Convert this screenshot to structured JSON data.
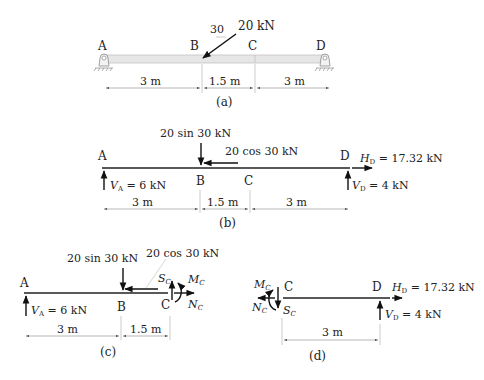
{
  "figure": {
    "part_a": {
      "caption": "(a)",
      "points": {
        "A": "A",
        "B": "B",
        "C": "C",
        "D": "D"
      },
      "load_label": "20 kN",
      "angle_label": "30",
      "dimensions": [
        "3 m",
        "1.5 m",
        "3 m"
      ]
    },
    "part_b": {
      "caption": "(b)",
      "points": {
        "A": "A",
        "B": "B",
        "C": "C",
        "D": "D"
      },
      "vertical_load_label": "20 sin 30 kN",
      "horizontal_load_label": "20 cos 30 kN",
      "VA": {
        "sym": "V",
        "sub": "A",
        "value": " = 6 kN"
      },
      "VD": {
        "sym": "V",
        "sub": "D",
        "value": " = 4 kN"
      },
      "HD": {
        "sym": "H",
        "sub": "D",
        "value": " = 17.32 kN"
      },
      "dimensions": [
        "3 m",
        "1.5 m",
        "3 m"
      ]
    },
    "part_c": {
      "caption": "(c)",
      "points": {
        "A": "A",
        "B": "B",
        "C": "C"
      },
      "vertical_load_label": "20 sin 30 kN",
      "horizontal_load_label": "20 cos 30 kN",
      "VA": {
        "sym": "V",
        "sub": "A",
        "value": " = 6 kN"
      },
      "SC": {
        "sym": "S",
        "sub": "C"
      },
      "MC": {
        "sym": "M",
        "sub": "C"
      },
      "NC": {
        "sym": "N",
        "sub": "C"
      },
      "dimensions": [
        "3 m",
        "1.5 m"
      ]
    },
    "part_d": {
      "caption": "(d)",
      "points": {
        "C": "C",
        "D": "D"
      },
      "HD": {
        "sym": "H",
        "sub": "D",
        "value": " = 17.32 kN"
      },
      "VD": {
        "sym": "V",
        "sub": "D",
        "value": " = 4 kN"
      },
      "SC": {
        "sym": "S",
        "sub": "C"
      },
      "MC": {
        "sym": "M",
        "sub": "C"
      },
      "NC": {
        "sym": "N",
        "sub": "C"
      },
      "dimensions": [
        "3 m"
      ]
    }
  }
}
